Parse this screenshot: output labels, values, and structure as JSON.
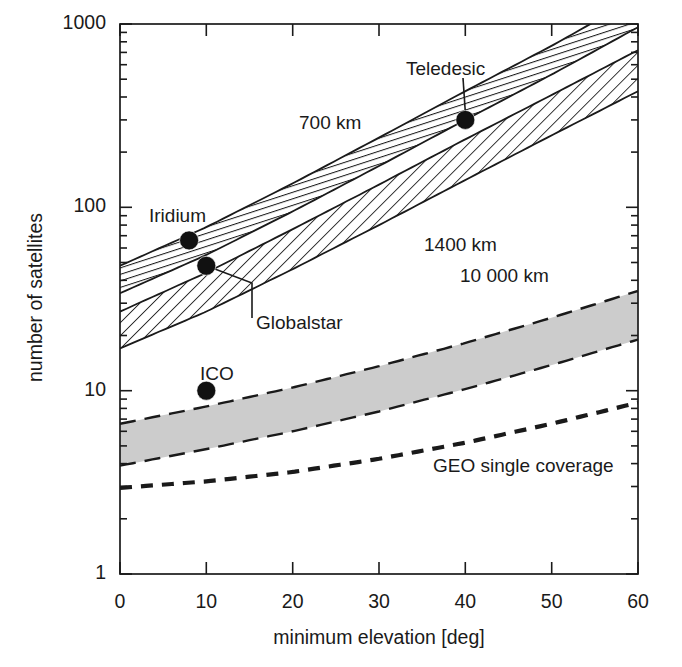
{
  "chart_data": {
    "type": "line",
    "title": "",
    "xlabel": "minimum elevation [deg]",
    "ylabel": "number of satellites",
    "xlim": [
      0,
      60
    ],
    "ylim": [
      1,
      1000
    ],
    "yscale": "log",
    "xscale": "linear",
    "grid": false,
    "legend_position": "inline-annotations",
    "xticks": [
      0,
      10,
      20,
      30,
      40,
      50,
      60
    ],
    "yticks": [
      1,
      10,
      100,
      1000
    ],
    "ytick_labels": [
      "1",
      "10",
      "100",
      "1000"
    ],
    "xtick_labels": [
      "0",
      "10",
      "20",
      "30",
      "40",
      "50",
      "60"
    ],
    "bands": [
      {
        "name": "700 km",
        "label": "700 km",
        "hatch": "vertical",
        "fill": "#ffffff",
        "edge": "#1a1a1a",
        "x": [
          0,
          10,
          20,
          30,
          40,
          50,
          60
        ],
        "upper": [
          48,
          78,
          135,
          240,
          430,
          760,
          1400
        ],
        "lower": [
          34,
          55,
          95,
          168,
          300,
          530,
          960
        ]
      },
      {
        "name": "1400 km",
        "label": "1400 km",
        "hatch": "diagonal",
        "fill": "#ffffff",
        "edge": "#1a1a1a",
        "x": [
          0,
          10,
          20,
          30,
          40,
          50,
          60
        ],
        "upper": [
          27,
          44,
          76,
          133,
          235,
          410,
          720
        ],
        "lower": [
          17,
          27,
          46,
          80,
          141,
          247,
          430
        ]
      },
      {
        "name": "10 000 km",
        "label": "10 000 km",
        "hatch": "none",
        "fill": "#cccccc",
        "edge": "#1a1a1a",
        "edge_style": "dashed",
        "x": [
          0,
          10,
          20,
          30,
          40,
          50,
          60
        ],
        "upper": [
          6.6,
          8.2,
          10.4,
          13.6,
          18.2,
          25.0,
          35.0
        ],
        "lower": [
          3.9,
          4.8,
          6.0,
          7.7,
          10.2,
          13.8,
          19.0
        ]
      }
    ],
    "curves": [
      {
        "name": "GEO single coverage",
        "label": "GEO single coverage",
        "style": "dashed",
        "color": "#1a1a1a",
        "x": [
          0,
          10,
          20,
          30,
          40,
          50,
          60
        ],
        "y": [
          2.95,
          3.2,
          3.6,
          4.25,
          5.2,
          6.6,
          8.6
        ]
      }
    ],
    "points": [
      {
        "name": "Iridium",
        "label": "Iridium",
        "x": 8,
        "y": 66,
        "marker": "filled-circle",
        "color": "#111111"
      },
      {
        "name": "Globalstar",
        "label": "Globalstar",
        "x": 10,
        "y": 48,
        "marker": "filled-circle",
        "color": "#111111"
      },
      {
        "name": "ICO",
        "label": "ICO",
        "x": 10,
        "y": 10,
        "marker": "filled-circle",
        "color": "#111111"
      },
      {
        "name": "Teledesic",
        "label": "Teledesic",
        "x": 40,
        "y": 300,
        "marker": "filled-circle",
        "color": "#111111"
      }
    ],
    "annotations": [
      {
        "text": "Teledesic",
        "x_px": 406,
        "y_px": 58,
        "leader": true
      },
      {
        "text": "700 km",
        "x_px": 299,
        "y_px": 112,
        "leader": false
      },
      {
        "text": "Iridium",
        "x_px": 149,
        "y_px": 205,
        "leader": false
      },
      {
        "text": "Globalstar",
        "x_px": 256,
        "y_px": 312,
        "leader": true
      },
      {
        "text": "1400 km",
        "x_px": 424,
        "y_px": 234,
        "leader": false
      },
      {
        "text": "10 000 km",
        "x_px": 460,
        "y_px": 265,
        "leader": false
      },
      {
        "text": "ICO",
        "x_px": 200,
        "y_px": 363,
        "leader": false
      },
      {
        "text": "GEO single coverage",
        "x_px": 433,
        "y_px": 455,
        "leader": false
      }
    ]
  },
  "axis": {
    "y_label": "number of satellites",
    "x_label": "minimum elevation [deg]",
    "y_ticks": [
      "1000",
      "100",
      "10",
      "1"
    ],
    "x_ticks": [
      "0",
      "10",
      "20",
      "30",
      "40",
      "50",
      "60"
    ]
  },
  "colors": {
    "axis": "#1a1a1a",
    "gray_band": "#cccccc",
    "marker": "#111111",
    "background": "#ffffff"
  }
}
